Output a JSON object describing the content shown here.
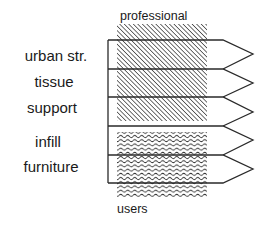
{
  "diagram": {
    "top_label": "professional",
    "bottom_label": "users",
    "levels": [
      {
        "label": "urban str.",
        "zone": "professional"
      },
      {
        "label": "tissue",
        "zone": "professional"
      },
      {
        "label": "support",
        "zone": "professional"
      },
      {
        "label": "infill",
        "zone": "users"
      },
      {
        "label": "furniture",
        "zone": "users"
      }
    ],
    "patterns": {
      "professional": "diagonal-hatch",
      "users": "wavy-lines"
    },
    "colors": {
      "line": "#2a2a2a",
      "hatch": "#333333",
      "background": "#ffffff"
    }
  }
}
